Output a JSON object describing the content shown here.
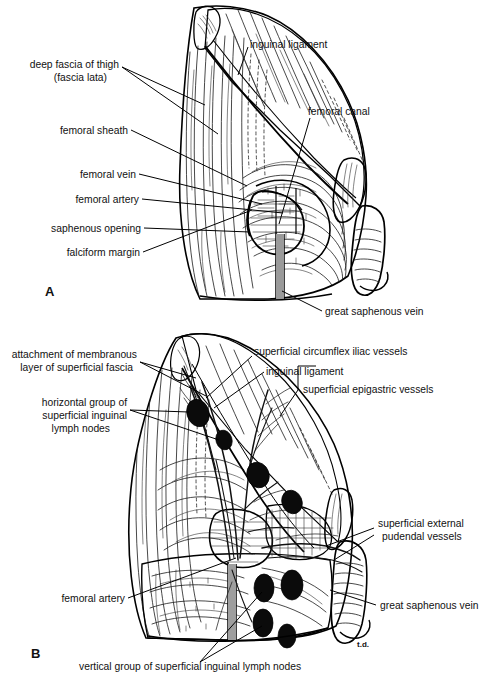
{
  "figure": {
    "background_color": "#ffffff",
    "ink_color": "#111111",
    "node_color": "#0b0b0b",
    "signature": "t.d."
  },
  "panel_a": {
    "letter": "A",
    "labels": {
      "deep_fascia_line1": "deep fascia of thigh",
      "deep_fascia_line2": "(fascia lata)",
      "femoral_sheath": "femoral sheath",
      "femoral_vein": "femoral vein",
      "femoral_artery": "femoral artery",
      "saphenous_opening": "saphenous opening",
      "falciform_margin": "falciform margin",
      "inguinal_ligament": "inguinal ligament",
      "femoral_canal": "femoral canal",
      "great_saphenous_vein": "great saphenous vein"
    }
  },
  "panel_b": {
    "letter": "B",
    "labels": {
      "attachment_line1": "attachment of membranous",
      "attachment_line2": "layer of superficial fascia",
      "horizontal_group_line1": "horizontal group of",
      "horizontal_group_line2": "superficial inguinal",
      "horizontal_group_line3": "lymph nodes",
      "superficial_circumflex": "superficial circumflex iliac vessels",
      "inguinal_ligament": "inguinal ligament",
      "superficial_epigastric": "superficial epigastric vessels",
      "superficial_external_line1": "superficial external",
      "superficial_external_line2": "pudendal vessels",
      "femoral_artery": "femoral artery",
      "great_saphenous_vein": "great saphenous vein",
      "vertical_group": "vertical group of superficial inguinal lymph nodes"
    }
  }
}
